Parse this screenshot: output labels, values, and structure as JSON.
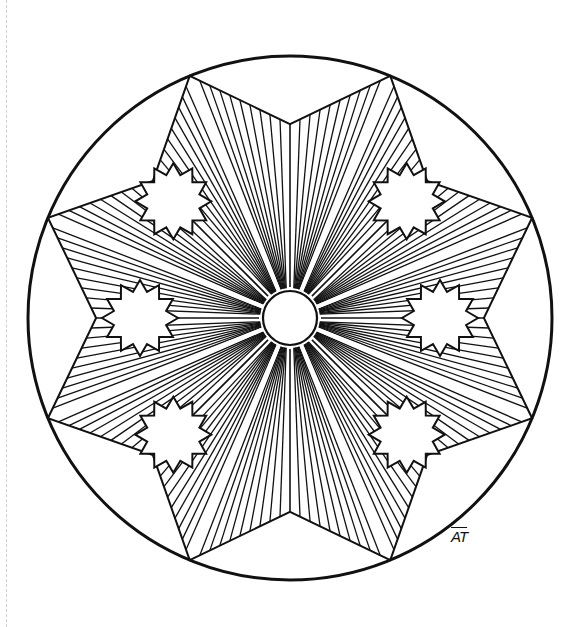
{
  "artwork": {
    "type": "mandala coloring page",
    "signature": "AT",
    "stroke_color": "#111111",
    "background_color": "#ffffff",
    "outer_circle": {
      "cx": 290,
      "cy": 318,
      "r": 262
    },
    "center_circle": {
      "cx": 290,
      "cy": 318,
      "r": 27
    },
    "star_points": 8,
    "starburst_count": 6,
    "starburst_points": 12
  }
}
